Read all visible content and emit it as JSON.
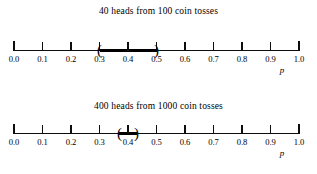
{
  "figure": {
    "axis_label": "p",
    "axis_min": 0.0,
    "axis_max": 1.0,
    "tick_labels": [
      "0.0",
      "0.1",
      "0.2",
      "0.3",
      "0.4",
      "0.5",
      "0.6",
      "0.7",
      "0.8",
      "0.9",
      "1.0"
    ]
  },
  "panels": [
    {
      "title": "40 heads from 100 coin tosses",
      "axis_label": "p",
      "interval_low_label": "0.30",
      "interval_high_label": "0.50",
      "point_estimate_label": "0.40",
      "open_paren": "(",
      "close_paren": ")"
    },
    {
      "title": "400 heads from 1000 coin tosses",
      "axis_label": "p",
      "interval_low_label": "0.37",
      "interval_high_label": "0.43",
      "point_estimate_label": "0.40",
      "open_paren": "(",
      "close_paren": ")"
    }
  ],
  "chart_data": {
    "type": "line",
    "xlabel": "p",
    "ylabel": "",
    "xlim": [
      0.0,
      1.0
    ],
    "grid": false,
    "legend": "none",
    "xticks": [
      0.0,
      0.1,
      0.2,
      0.3,
      0.4,
      0.5,
      0.6,
      0.7,
      0.8,
      0.9,
      1.0
    ],
    "xticklabels": [
      "0.0",
      "0.1",
      "0.2",
      "0.3",
      "0.4",
      "0.5",
      "0.6",
      "0.7",
      "0.8",
      "0.9",
      "1.0"
    ],
    "series": [
      {
        "name": "40 heads from 100 coin tosses",
        "point_estimate": 0.4,
        "interval_low": 0.3,
        "interval_high": 0.5,
        "n": 100,
        "heads": 40
      },
      {
        "name": "400 heads from 1000 coin tosses",
        "point_estimate": 0.4,
        "interval_low": 0.37,
        "interval_high": 0.43,
        "n": 1000,
        "heads": 400
      }
    ]
  }
}
